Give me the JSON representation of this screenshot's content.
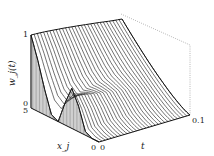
{
  "chart_data": {
    "type": "surface",
    "title": "",
    "zlabel": "w_j(t)",
    "xlabel": "x_j",
    "ylabel": "t",
    "x_range": [
      0,
      5
    ],
    "t_range": [
      0,
      0.1
    ],
    "z_range": [
      0,
      1
    ],
    "tick_labels": {
      "z": [
        "0",
        "1"
      ],
      "x": [
        "5",
        "0"
      ],
      "t": [
        "0",
        "0.1"
      ]
    },
    "initial_profile": [
      {
        "x": 5.0,
        "w": 1.0
      },
      {
        "x": 4.5,
        "w": 0.7
      },
      {
        "x": 4.0,
        "w": 0.35
      },
      {
        "x": 3.5,
        "w": 0.05
      },
      {
        "x": 3.0,
        "w": 0.0
      },
      {
        "x": 2.5,
        "w": 0.3
      },
      {
        "x": 2.0,
        "w": 0.55
      },
      {
        "x": 1.5,
        "w": 0.35
      },
      {
        "x": 1.0,
        "w": 0.05
      },
      {
        "x": 0.5,
        "w": 0.0
      },
      {
        "x": 0.0,
        "w": 0.0
      }
    ],
    "num_time_curves": 30,
    "grid": false,
    "legend": null
  },
  "labels": {
    "z_tick_top": "1",
    "z_tick_bottom": "0",
    "x_tick_far": "5",
    "x_tick_near": "0",
    "t_tick_start": "0",
    "t_tick_end": "0.1",
    "z_axis_title": "w_j(t)",
    "x_axis_title": "x_j",
    "t_axis_title": "t"
  },
  "colors": {
    "line": "#333333",
    "hatch": "#555555",
    "box": "#888888"
  }
}
